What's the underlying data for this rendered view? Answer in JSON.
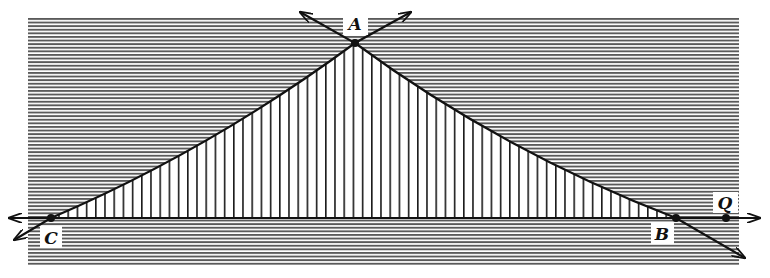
{
  "diagram": {
    "type": "geometry-figure",
    "colors": {
      "background": "#ffffff",
      "ink": "#111111",
      "hatch": "#555555",
      "label_bg": "#ffffff"
    },
    "region": {
      "x": 28,
      "y": 17,
      "width": 711,
      "height": 248
    },
    "points": [
      {
        "id": "A",
        "label": "A",
        "x": 355,
        "y": 43,
        "label_x": 355,
        "label_y": 30
      },
      {
        "id": "B",
        "label": "B",
        "x": 676,
        "y": 218,
        "label_x": 662,
        "label_y": 239
      },
      {
        "id": "C",
        "label": "C",
        "x": 51,
        "y": 218,
        "label_x": 51,
        "label_y": 243
      },
      {
        "id": "Q",
        "label": "Q",
        "x": 726,
        "y": 218,
        "label_x": 725,
        "label_y": 208
      }
    ],
    "lines": [
      {
        "name": "line-CB",
        "from": [
          7,
          218
        ],
        "to": [
          762,
          218
        ],
        "arrows": "both"
      },
      {
        "name": "line-CA",
        "from": [
          14,
          240
        ],
        "to": [
          300,
          12
        ],
        "arrows": "both"
      },
      {
        "name": "line-AB",
        "from": [
          411,
          12
        ],
        "to": [
          745,
          258
        ],
        "arrows": "both"
      }
    ],
    "hatching": {
      "exterior": "horizontal",
      "interior": "vertical",
      "horizontal_spacing": 3.6,
      "vertical_spacing": 9.2
    }
  }
}
